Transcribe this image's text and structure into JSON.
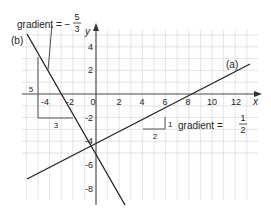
{
  "diagram": {
    "axes": {
      "x_label": "x",
      "y_label": "y",
      "x_ticks": [
        "-4",
        "-2",
        "0",
        "2",
        "4",
        "6",
        "8",
        "10",
        "12"
      ],
      "y_ticks": [
        "4",
        "2",
        "-2",
        "-4",
        "-6",
        "-8"
      ]
    },
    "lines": [
      {
        "id": "a",
        "label": "(a)",
        "gradient_text": "gradient =",
        "gradient_num": "1",
        "gradient_den": "2",
        "run": "2",
        "rise": "1"
      },
      {
        "id": "b",
        "label": "(b)",
        "gradient_text": "gradient = −",
        "gradient_num": "5",
        "gradient_den": "3",
        "run": "3",
        "rise": "5"
      }
    ],
    "colors": {
      "grid": "#d9d9d9",
      "axis": "#555555",
      "line": "#222222",
      "triangle": "#555555"
    }
  }
}
